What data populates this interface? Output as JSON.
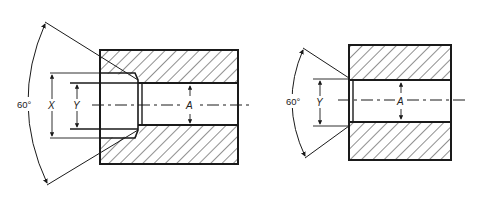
{
  "diagram": {
    "type": "technical-section-drawing",
    "stroke_color": "#1a1a1a",
    "background": "#ffffff",
    "figures": [
      {
        "id": "left",
        "description": "Counterbored hole with 60° chamfer",
        "labels": {
          "angle": "60°",
          "counterbore_diameter": "X",
          "drill_diameter": "Y",
          "bore": "A"
        }
      },
      {
        "id": "right",
        "description": "Through hole with 60° chamfer",
        "labels": {
          "angle": "60°",
          "drill_diameter": "Y",
          "bore": "A"
        }
      }
    ]
  }
}
